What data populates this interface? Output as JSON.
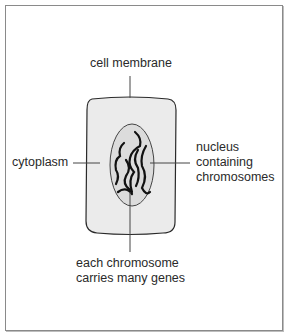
{
  "diagram": {
    "labels": {
      "cell_membrane": "cell membrane",
      "cytoplasm": "cytoplasm",
      "nucleus_line1": "nucleus",
      "nucleus_line2": "containing",
      "nucleus_line3": "chromosomes",
      "chromosome_line1": "each chromosome",
      "chromosome_line2": "carries many genes"
    },
    "colors": {
      "cytoplasm_fill": "#ebebeb",
      "nucleus_fill": "#dcdcdc",
      "outline": "#2a2a2a",
      "chromosome": "#111111",
      "frame": "#8a8a8a"
    }
  }
}
